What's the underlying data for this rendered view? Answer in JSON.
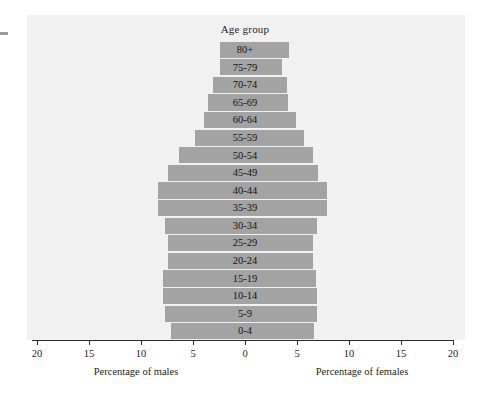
{
  "figure": {
    "title": "Age group",
    "background_color": "#f1f1f1",
    "bar_color": "#a3a3a3",
    "axis_color": "#2b2b2b",
    "text_color": "#1d1d1d"
  },
  "axis": {
    "ticks": [
      {
        "label": "20",
        "value": -20
      },
      {
        "label": "15",
        "value": -15
      },
      {
        "label": "10",
        "value": -10
      },
      {
        "label": "5",
        "value": -5
      },
      {
        "label": "0",
        "value": 0
      },
      {
        "label": "5",
        "value": 5
      },
      {
        "label": "10",
        "value": 10
      },
      {
        "label": "15",
        "value": 15
      },
      {
        "label": "20",
        "value": 20
      }
    ],
    "left_caption": "Percentage of males",
    "right_caption": "Percentage of females"
  },
  "chart_data": {
    "type": "bar",
    "subtype": "population-pyramid",
    "title": "Age group",
    "xlabel": "",
    "ylabel": "Age group",
    "xlim": [
      -20,
      20
    ],
    "grid": false,
    "legend": "none",
    "x_tick_labels": [
      "20",
      "15",
      "10",
      "5",
      "0",
      "5",
      "10",
      "15",
      "20"
    ],
    "x_tick_values": [
      -20,
      -15,
      -10,
      -5,
      0,
      5,
      10,
      15,
      20
    ],
    "left_axis_caption": "Percentage of males",
    "right_axis_caption": "Percentage of females",
    "categories": [
      "80+",
      "75-79",
      "70-74",
      "65-69",
      "60-64",
      "55-59",
      "50-54",
      "45-49",
      "40-44",
      "35-39",
      "30-34",
      "25-29",
      "20-24",
      "15-19",
      "10-14",
      "5-9",
      "0-4"
    ],
    "series": [
      {
        "name": "Percentage of males",
        "side": "left",
        "values": [
          2.4,
          2.4,
          3.1,
          3.6,
          3.9,
          4.8,
          6.3,
          7.4,
          8.4,
          8.4,
          7.7,
          7.4,
          7.4,
          7.9,
          7.9,
          7.7,
          7.1
        ]
      },
      {
        "name": "Percentage of females",
        "side": "right",
        "values": [
          4.2,
          3.6,
          4.0,
          4.1,
          4.9,
          5.7,
          6.5,
          7.0,
          7.9,
          7.9,
          6.9,
          6.5,
          6.5,
          6.8,
          6.9,
          6.9,
          6.6
        ]
      }
    ]
  }
}
